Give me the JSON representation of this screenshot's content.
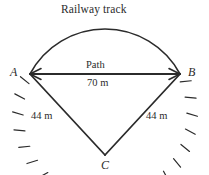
{
  "figure": {
    "title": "Railway track",
    "width": 209,
    "height": 175,
    "background_color": "#ffffff",
    "stroke_color": "#2b2b2b"
  },
  "labels": {
    "title": "Railway track",
    "path": "Path",
    "base_length": "70 m",
    "left_side_length": "44 m",
    "right_side_length": "44 m",
    "vertex_a": "A",
    "vertex_b": "B",
    "vertex_c": "C"
  },
  "geometry": {
    "point_a": {
      "x": 30,
      "y": 74
    },
    "point_b": {
      "x": 180,
      "y": 74
    },
    "point_c": {
      "x": 105,
      "y": 155
    },
    "arc_apex": {
      "x": 105,
      "y": 29
    },
    "chord_length_label": "70 m",
    "radius_label": "44 m",
    "tick_count": 21,
    "tick_length": 11
  },
  "chart_data": {
    "type": "diagram",
    "title": "Railway track",
    "shape": "circular sector with arc (railway track) and chord (path)",
    "vertices": [
      "A",
      "B",
      "C"
    ],
    "measurements": [
      {
        "segment": "AB",
        "label": "Path",
        "value": "70 m"
      },
      {
        "segment": "AC",
        "label": "",
        "value": "44 m"
      },
      {
        "segment": "BC",
        "label": "",
        "value": "44 m"
      }
    ],
    "arc_label": "Railway track",
    "arc_endpoints": [
      "A",
      "B"
    ],
    "apex": "C"
  }
}
